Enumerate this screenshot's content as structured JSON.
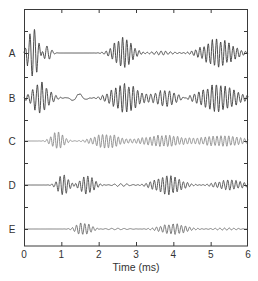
{
  "chart_data": {
    "type": "line",
    "title": "",
    "xlabel": "Time (ms)",
    "ylabel": "",
    "xlim": [
      0,
      6
    ],
    "x_ticks": [
      0,
      1,
      2,
      3,
      4,
      5,
      6
    ],
    "x_tick_labels": [
      "0",
      "1",
      "2",
      "3",
      "4",
      "5",
      "6"
    ],
    "grid": false,
    "legend": "none",
    "layout": "stacked traces, one per row, offset vertically, labeled at left",
    "series": [
      {
        "name": "A",
        "color": "#3c3c3c",
        "description": "Large initial transient 0-0.6 ms with ring-down to ~0.8 ms, flat to ~1.9 ms, wave packet 2.1-3.3 ms peaking ~2.6 ms, low ripple 3.3-4.4 ms, second wave packet 4.3-6.0 ms peaking ~5.2 ms",
        "packets": [
          {
            "t0": 0.25,
            "width": 0.18,
            "amp": 1.6,
            "freq": 8.0
          },
          {
            "t0": 0.6,
            "width": 0.15,
            "amp": 0.5,
            "freq": 7.0
          },
          {
            "t0": 2.65,
            "width": 0.32,
            "amp": 1.0,
            "freq": 9.0
          },
          {
            "t0": 3.7,
            "width": 0.35,
            "amp": 0.12,
            "freq": 8.0
          },
          {
            "t0": 5.2,
            "width": 0.5,
            "amp": 0.85,
            "freq": 9.0
          }
        ]
      },
      {
        "name": "B",
        "color": "#3c3c3c",
        "description": "Initial step and oscillation 0-1 ms, slow undershoot ~1.2-1.8 ms, continuous strong oscillation from ~2 ms to 6 ms with amplitude peaks near 2.7 ms and 5.1 ms",
        "packets": [
          {
            "t0": 0.45,
            "width": 0.3,
            "amp": 1.0,
            "freq": 8.0
          },
          {
            "t0": 1.45,
            "width": 0.2,
            "amp": 0.3,
            "freq": 2.5
          },
          {
            "t0": 2.7,
            "width": 0.45,
            "amp": 0.95,
            "freq": 8.5
          },
          {
            "t0": 3.8,
            "width": 0.4,
            "amp": 0.55,
            "freq": 8.0
          },
          {
            "t0": 5.2,
            "width": 0.6,
            "amp": 0.9,
            "freq": 8.5
          }
        ]
      },
      {
        "name": "C",
        "color": "#8a8a8a",
        "description": "Light-gray trace; flat until ~0.5 ms, packet 0.6-1.3 ms, then sustained moderate oscillation 1.5-6 ms",
        "packets": [
          {
            "t0": 0.9,
            "width": 0.22,
            "amp": 0.75,
            "freq": 9.5
          },
          {
            "t0": 2.2,
            "width": 0.45,
            "amp": 0.6,
            "freq": 9.5
          },
          {
            "t0": 3.7,
            "width": 0.7,
            "amp": 0.5,
            "freq": 9.5
          },
          {
            "t0": 5.3,
            "width": 0.7,
            "amp": 0.45,
            "freq": 9.5
          }
        ]
      },
      {
        "name": "D",
        "color": "#4a4a4a",
        "description": "Flat until ~0.7 ms, packet 0.8-2.2 ms with peaks ~1.0 and ~1.7 ms, small ripple ~2.3-2.8 ms, packet 2.9-4.6 ms peaking ~3.8 ms, continuing moderate oscillation to 6 ms",
        "packets": [
          {
            "t0": 1.05,
            "width": 0.2,
            "amp": 0.75,
            "freq": 9.0
          },
          {
            "t0": 1.7,
            "width": 0.25,
            "amp": 0.7,
            "freq": 9.0
          },
          {
            "t0": 2.6,
            "width": 0.25,
            "amp": 0.12,
            "freq": 6.0
          },
          {
            "t0": 3.85,
            "width": 0.45,
            "amp": 0.75,
            "freq": 9.0
          },
          {
            "t0": 5.5,
            "width": 0.45,
            "amp": 0.4,
            "freq": 9.0
          }
        ]
      },
      {
        "name": "E",
        "color": "#6a6a6a",
        "description": "Flat until ~1 ms, packet 1.1-2.1 ms peaking ~1.6 ms, low ripple 2.1-3.2 ms, packet 3.3-4.8 ms peaking ~4.0 ms, low ripple to 6 ms",
        "packets": [
          {
            "t0": 1.6,
            "width": 0.25,
            "amp": 0.7,
            "freq": 9.0
          },
          {
            "t0": 2.5,
            "width": 0.4,
            "amp": 0.08,
            "freq": 6.0
          },
          {
            "t0": 4.0,
            "width": 0.45,
            "amp": 0.55,
            "freq": 9.0
          },
          {
            "t0": 5.4,
            "width": 0.4,
            "amp": 0.12,
            "freq": 8.0
          }
        ]
      }
    ]
  },
  "rows": [
    {
      "label": "A",
      "baseline_y": 53,
      "scale": 28
    },
    {
      "label": "B",
      "baseline_y": 98,
      "scale": 26
    },
    {
      "label": "C",
      "baseline_y": 141,
      "scale": 20
    },
    {
      "label": "D",
      "baseline_y": 185,
      "scale": 22
    },
    {
      "label": "E",
      "baseline_y": 229,
      "scale": 16
    }
  ],
  "layout": {
    "frame": {
      "left": 24,
      "right": 248,
      "top": 9,
      "bottom": 246
    },
    "y_tick_positions": [
      31,
      77,
      120,
      163,
      207
    ]
  }
}
